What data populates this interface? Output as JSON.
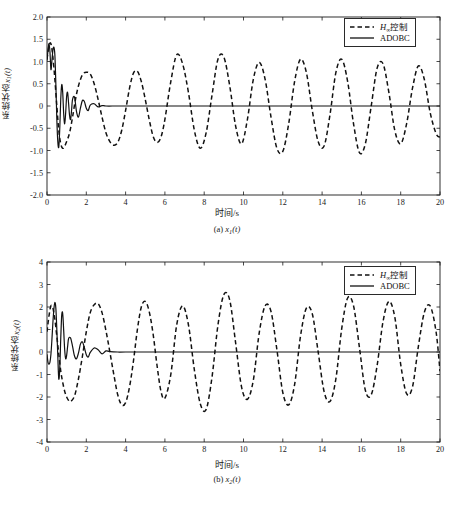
{
  "figure": {
    "background": "#ffffff",
    "axis_color": "#1a1a1a",
    "series_colors": {
      "hinf": "#111111",
      "adobc": "#111111"
    }
  },
  "panels": [
    {
      "id": "a",
      "caption_prefix": "(a) ",
      "caption_var": "x",
      "caption_sub": "1",
      "caption_suffix": "(t)",
      "xlabel": "时间/s",
      "ylabel_prefix": "系统状态",
      "ylabel_var": "x",
      "ylabel_sub": "1",
      "ylabel_suffix": "(t)",
      "legend": {
        "items": [
          {
            "label_prefix": "H",
            "label_sub": "∞",
            "label_suffix": "控制",
            "style": "dashed",
            "name": "hinf-control"
          },
          {
            "label_prefix": "ADOBC",
            "label_sub": "",
            "label_suffix": "",
            "style": "solid",
            "name": "adobc"
          }
        ]
      }
    },
    {
      "id": "b",
      "caption_prefix": "(b) ",
      "caption_var": "x",
      "caption_sub": "2",
      "caption_suffix": "(t)",
      "xlabel": "时间/s",
      "ylabel_prefix": "系统状态",
      "ylabel_var": "x",
      "ylabel_sub": "2",
      "ylabel_suffix": "(t)",
      "legend": {
        "items": [
          {
            "label_prefix": "H",
            "label_sub": "∞",
            "label_suffix": "控制",
            "style": "dashed",
            "name": "hinf-control"
          },
          {
            "label_prefix": "ADOBC",
            "label_sub": "",
            "label_suffix": "",
            "style": "solid",
            "name": "adobc"
          }
        ]
      }
    }
  ],
  "chart_data": [
    {
      "type": "line",
      "panel": "a",
      "title": "(a) x1(t)",
      "xlabel": "时间/s",
      "ylabel": "系统状态x1(t)",
      "xlim": [
        0,
        20
      ],
      "ylim": [
        -2.0,
        2.0
      ],
      "xticks": [
        0,
        2,
        4,
        6,
        8,
        10,
        12,
        14,
        16,
        18,
        20
      ],
      "yticks": [
        -2.0,
        -1.5,
        -1.0,
        -0.5,
        0,
        0.5,
        1.0,
        1.5,
        2.0
      ],
      "ytick_labels": [
        "-2.0",
        "-1.5",
        "-1.0",
        "-0.5",
        "0",
        "0.5",
        "1.0",
        "1.5",
        "2.0"
      ],
      "grid": false,
      "legend_position": "top-right",
      "series": [
        {
          "name": "H∞控制",
          "style": "dashed",
          "color": "#111111",
          "description": "Sustained beating oscillation, period ~2.2 s, amplitude 0.75-1.2, never decays",
          "points_t": [
            0.0,
            0.1,
            0.2,
            0.3,
            0.4,
            0.5,
            0.6,
            0.7,
            0.8,
            0.9,
            1.0,
            1.15,
            1.3,
            1.45,
            1.6,
            1.8,
            2.0,
            2.2,
            2.4,
            2.6,
            2.8,
            3.0,
            3.2,
            3.4,
            3.6,
            3.8,
            4.0,
            4.2,
            4.4,
            4.6,
            4.8,
            5.0,
            5.2,
            5.4,
            5.6,
            5.8,
            6.0,
            6.3,
            6.6,
            6.9,
            7.2,
            7.5,
            7.8,
            8.1,
            8.4,
            8.7,
            9.0,
            9.3,
            9.6,
            9.9,
            10.2,
            10.5,
            10.8,
            11.1,
            11.4,
            11.7,
            12.0,
            12.3,
            12.6,
            12.9,
            13.2,
            13.5,
            13.8,
            14.1,
            14.4,
            14.7,
            15.0,
            15.3,
            15.6,
            15.9,
            16.2,
            16.5,
            16.8,
            17.1,
            17.4,
            17.7,
            18.0,
            18.3,
            18.6,
            18.9,
            19.2,
            19.5,
            19.8,
            20.0
          ],
          "points_y": [
            1.05,
            1.35,
            1.4,
            1.1,
            0.6,
            0.0,
            -0.55,
            -0.85,
            -0.95,
            -0.9,
            -0.8,
            -0.6,
            -0.25,
            0.15,
            0.45,
            0.7,
            0.76,
            0.72,
            0.5,
            0.15,
            -0.25,
            -0.6,
            -0.8,
            -0.88,
            -0.82,
            -0.55,
            -0.1,
            0.4,
            0.74,
            0.78,
            0.55,
            0.15,
            -0.3,
            -0.68,
            -0.82,
            -0.7,
            -0.3,
            0.55,
            1.15,
            0.95,
            0.3,
            -0.55,
            -0.95,
            -0.6,
            0.25,
            1.05,
            1.1,
            0.45,
            -0.45,
            -0.85,
            -0.3,
            0.6,
            0.98,
            0.6,
            -0.25,
            -0.95,
            -1.02,
            -0.4,
            0.55,
            1.05,
            0.75,
            -0.1,
            -0.8,
            -0.9,
            -0.2,
            0.75,
            1.05,
            0.55,
            -0.4,
            -1.05,
            -0.85,
            0.0,
            0.85,
            0.95,
            0.3,
            -0.55,
            -0.85,
            -0.4,
            0.4,
            0.9,
            0.6,
            -0.15,
            -0.62,
            -0.7
          ]
        },
        {
          "name": "ADOBC",
          "style": "solid",
          "color": "#111111",
          "description": "Rapid damped transient: overshoot to 1.4 at t≈0.15, undershoot to -0.92 at t≈0.62, settles to 0 by t≈3",
          "points_t": [
            0.0,
            0.05,
            0.1,
            0.15,
            0.2,
            0.25,
            0.3,
            0.35,
            0.4,
            0.45,
            0.5,
            0.55,
            0.6,
            0.65,
            0.7,
            0.75,
            0.8,
            0.85,
            0.9,
            0.95,
            1.0,
            1.05,
            1.1,
            1.15,
            1.2,
            1.25,
            1.3,
            1.4,
            1.5,
            1.6,
            1.7,
            1.8,
            1.9,
            2.0,
            2.1,
            2.2,
            2.4,
            2.6,
            2.8,
            3.0,
            3.5,
            4.0,
            6.0,
            8.0,
            12.0,
            16.0,
            20.0
          ],
          "points_y": [
            1.02,
            1.25,
            1.4,
            1.22,
            0.82,
            1.02,
            1.25,
            1.32,
            1.15,
            0.5,
            -0.3,
            -0.8,
            -0.92,
            -0.5,
            0.15,
            0.48,
            0.3,
            -0.18,
            -0.4,
            -0.15,
            0.22,
            0.3,
            0.05,
            -0.22,
            -0.3,
            -0.1,
            0.15,
            0.2,
            -0.12,
            -0.25,
            -0.05,
            0.12,
            0.1,
            -0.05,
            -0.1,
            0.02,
            0.05,
            -0.02,
            0.01,
            0.0,
            0.0,
            0.0,
            0.0,
            0.0,
            0.0,
            0.0,
            0.0
          ]
        }
      ]
    },
    {
      "type": "line",
      "panel": "b",
      "title": "(b) x2(t)",
      "xlabel": "时间/s",
      "ylabel": "系统状态x2(t)",
      "xlim": [
        0,
        20
      ],
      "ylim": [
        -4,
        4
      ],
      "xticks": [
        0,
        2,
        4,
        6,
        8,
        10,
        12,
        14,
        16,
        18,
        20
      ],
      "yticks": [
        -4,
        -3,
        -2,
        -1,
        0,
        1,
        2,
        3,
        4
      ],
      "ytick_labels": [
        "-4",
        "-3",
        "-2",
        "-1",
        "0",
        "1",
        "2",
        "3",
        "4"
      ],
      "grid": false,
      "legend_position": "top-right",
      "series": [
        {
          "name": "H∞控制",
          "style": "dashed",
          "color": "#111111",
          "description": "Sustained beating oscillation, period ~2.1 s, amplitude 1.8-2.6, never decays",
          "points_t": [
            0.0,
            0.1,
            0.2,
            0.3,
            0.4,
            0.5,
            0.6,
            0.7,
            0.8,
            0.9,
            1.0,
            1.1,
            1.2,
            1.4,
            1.6,
            1.8,
            2.0,
            2.2,
            2.4,
            2.6,
            2.8,
            3.0,
            3.2,
            3.4,
            3.6,
            3.8,
            4.0,
            4.2,
            4.4,
            4.6,
            4.8,
            5.0,
            5.2,
            5.4,
            5.6,
            5.8,
            6.0,
            6.3,
            6.6,
            6.9,
            7.2,
            7.5,
            7.8,
            8.1,
            8.4,
            8.7,
            9.0,
            9.3,
            9.6,
            9.9,
            10.2,
            10.5,
            10.8,
            11.1,
            11.4,
            11.7,
            12.0,
            12.3,
            12.6,
            12.9,
            13.2,
            13.5,
            13.8,
            14.1,
            14.4,
            14.7,
            15.0,
            15.3,
            15.6,
            15.9,
            16.2,
            16.5,
            16.8,
            17.1,
            17.4,
            17.7,
            18.0,
            18.3,
            18.6,
            18.9,
            19.2,
            19.5,
            19.8,
            20.0
          ],
          "points_y": [
            0.9,
            1.6,
            2.05,
            1.95,
            1.45,
            0.7,
            -0.1,
            -0.85,
            -1.35,
            -1.75,
            -2.0,
            -2.15,
            -2.2,
            -1.95,
            -1.2,
            -0.2,
            0.9,
            1.75,
            2.1,
            2.15,
            1.75,
            0.95,
            0.0,
            -1.0,
            -1.9,
            -2.35,
            -2.25,
            -1.55,
            -0.4,
            1.0,
            2.0,
            2.25,
            1.8,
            0.8,
            -0.6,
            -1.75,
            -2.05,
            -1.0,
            1.2,
            2.05,
            1.2,
            -0.8,
            -2.3,
            -2.55,
            -1.1,
            1.2,
            2.55,
            2.3,
            0.4,
            -1.55,
            -2.1,
            -1.25,
            0.85,
            2.05,
            1.8,
            0.1,
            -1.8,
            -2.35,
            -1.45,
            0.7,
            1.95,
            1.7,
            0.0,
            -1.75,
            -2.2,
            -1.2,
            1.05,
            2.4,
            2.05,
            0.2,
            -1.7,
            -1.9,
            -0.6,
            1.35,
            2.25,
            1.55,
            -0.55,
            -1.85,
            -1.55,
            0.25,
            1.75,
            2.05,
            0.9,
            -0.85
          ]
        },
        {
          "name": "ADOBC",
          "style": "solid",
          "color": "#111111",
          "description": "Rapid damped transient: spike to 2.2 at t≈0.42, dip to -1.2 at t≈0.6, settles to 0 by t≈3.2",
          "points_t": [
            0.0,
            0.05,
            0.1,
            0.15,
            0.2,
            0.25,
            0.3,
            0.35,
            0.4,
            0.45,
            0.5,
            0.55,
            0.6,
            0.65,
            0.7,
            0.75,
            0.8,
            0.85,
            0.9,
            0.95,
            1.0,
            1.05,
            1.1,
            1.2,
            1.3,
            1.4,
            1.5,
            1.6,
            1.7,
            1.8,
            1.9,
            2.0,
            2.1,
            2.2,
            2.4,
            2.6,
            2.8,
            3.0,
            3.2,
            3.6,
            4.0,
            6.0,
            8.0,
            12.0,
            16.0,
            20.0
          ],
          "points_y": [
            -0.1,
            -0.45,
            -0.55,
            -0.45,
            -0.1,
            0.55,
            1.3,
            1.9,
            2.2,
            1.95,
            1.0,
            -0.2,
            -1.2,
            -0.7,
            0.6,
            1.65,
            1.7,
            0.95,
            0.1,
            -0.3,
            -0.15,
            0.25,
            0.6,
            0.62,
            0.25,
            -0.18,
            -0.3,
            -0.05,
            0.35,
            0.45,
            0.2,
            -0.12,
            -0.22,
            -0.02,
            0.18,
            0.1,
            -0.08,
            0.05,
            0.02,
            0.0,
            0.0,
            0.0,
            0.0,
            0.0,
            0.0,
            0.0
          ]
        }
      ]
    }
  ]
}
